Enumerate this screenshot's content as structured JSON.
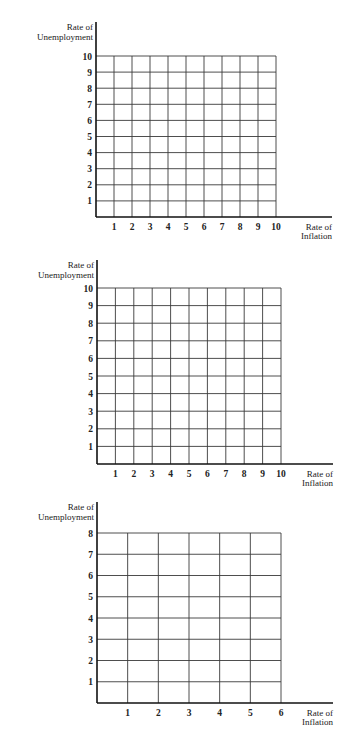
{
  "chart_data": [
    {
      "type": "line",
      "title": "",
      "xlabel": "Rate of Inflation",
      "ylabel": "Rate of Unemployment",
      "xlabel_lines": [
        "Rate of",
        "Inflation"
      ],
      "ylabel_lines": [
        "Rate of",
        "Unemployment"
      ],
      "x_ticks": [
        1,
        2,
        3,
        4,
        5,
        6,
        7,
        8,
        9,
        10
      ],
      "y_ticks": [
        1,
        2,
        3,
        4,
        5,
        6,
        7,
        8,
        9,
        10
      ],
      "xlim": [
        0,
        10
      ],
      "ylim": [
        0,
        10
      ],
      "grid": true,
      "series": [],
      "note": "Blank graph grid, no data plotted"
    },
    {
      "type": "line",
      "title": "",
      "xlabel": "Rate of Inflation",
      "ylabel": "Rate of Unemployment",
      "xlabel_lines": [
        "Rate of",
        "Inflation"
      ],
      "ylabel_lines": [
        "Rate of",
        "Unemployment"
      ],
      "x_ticks": [
        1,
        2,
        3,
        4,
        5,
        6,
        7,
        8,
        9,
        10
      ],
      "y_ticks": [
        1,
        2,
        3,
        4,
        5,
        6,
        7,
        8,
        9,
        10
      ],
      "xlim": [
        0,
        10
      ],
      "ylim": [
        0,
        10
      ],
      "grid": true,
      "series": [],
      "note": "Blank graph grid, no data plotted"
    },
    {
      "type": "line",
      "title": "",
      "xlabel": "Rate of Inflation",
      "ylabel": "Rate of Unemployment",
      "xlabel_lines": [
        "Rate of",
        "Inflation"
      ],
      "ylabel_lines": [
        "Rate of",
        "Unemployment"
      ],
      "x_ticks": [
        1,
        2,
        3,
        4,
        5,
        6
      ],
      "y_ticks": [
        1,
        2,
        3,
        4,
        5,
        6,
        7,
        8
      ],
      "xlim": [
        0,
        6
      ],
      "ylim": [
        0,
        8
      ],
      "grid": true,
      "series": [],
      "note": "Blank graph grid, no data plotted"
    }
  ],
  "layout": {
    "charts": [
      {
        "axis_x": 96,
        "axis_top": 22,
        "grid_left": 96,
        "grid_right": 276,
        "grid_top": 56,
        "grid_bottom": 217,
        "axis_right": 332
      },
      {
        "axis_x": 97,
        "axis_top": 260,
        "grid_left": 97,
        "grid_right": 281,
        "grid_top": 288,
        "grid_bottom": 464,
        "axis_right": 333
      },
      {
        "axis_x": 97,
        "axis_top": 502,
        "grid_left": 97,
        "grid_right": 281,
        "grid_top": 533,
        "grid_bottom": 703,
        "axis_right": 333
      }
    ],
    "colors": {
      "grid": "#3a3a3a",
      "axis": "#111111",
      "text": "#222222"
    }
  }
}
